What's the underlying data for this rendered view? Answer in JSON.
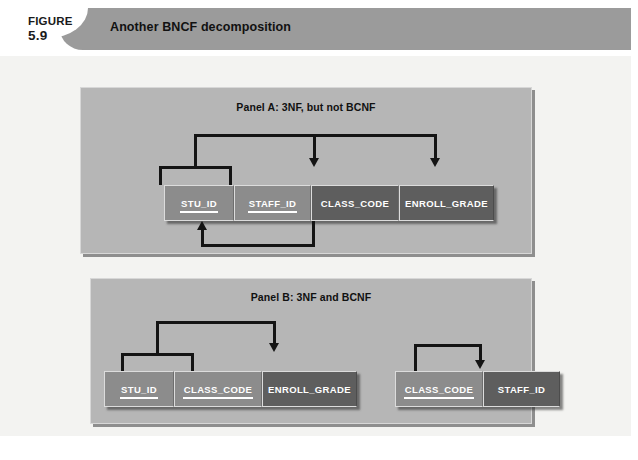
{
  "figure": {
    "label": "FIGURE",
    "number": "5.9",
    "caption": "Another BNCF decomposition"
  },
  "colors": {
    "header_band": "#9b9b9b",
    "page_background": "#f3f3f1",
    "panel_background": "#b6b6b6",
    "key_attribute": "#8c8c8c",
    "nonkey_attribute": "#5e5e5e",
    "arrow": "#141414",
    "attribute_text": "#ffffff"
  },
  "panels": [
    {
      "id": "panel-a",
      "title": "Panel A: 3NF, but not BCNF",
      "relations": [
        {
          "id": "relation-a1",
          "attributes": [
            {
              "name": "STU_ID",
              "key": true
            },
            {
              "name": "STAFF_ID",
              "key": true
            },
            {
              "name": "CLASS_CODE",
              "key": false
            },
            {
              "name": "ENROLL_GRADE",
              "key": false
            }
          ],
          "dependencies": [
            {
              "id": "dep-a-composite-key",
              "determinant": [
                "STU_ID",
                "STAFF_ID"
              ],
              "dependents": [
                "CLASS_CODE",
                "ENROLL_GRADE"
              ],
              "position": "above"
            },
            {
              "id": "dep-a-transitive",
              "determinant": [
                "CLASS_CODE"
              ],
              "dependents": [
                "STAFF_ID"
              ],
              "position": "below"
            }
          ]
        }
      ]
    },
    {
      "id": "panel-b",
      "title": "Panel B: 3NF and BCNF",
      "relations": [
        {
          "id": "relation-b1",
          "attributes": [
            {
              "name": "STU_ID",
              "key": true
            },
            {
              "name": "CLASS_CODE",
              "key": true
            },
            {
              "name": "ENROLL_GRADE",
              "key": false
            }
          ],
          "dependencies": [
            {
              "id": "dep-b1",
              "determinant": [
                "STU_ID",
                "CLASS_CODE"
              ],
              "dependents": [
                "ENROLL_GRADE"
              ],
              "position": "above"
            }
          ]
        },
        {
          "id": "relation-b2",
          "attributes": [
            {
              "name": "CLASS_CODE",
              "key": true
            },
            {
              "name": "STAFF_ID",
              "key": false
            }
          ],
          "dependencies": [
            {
              "id": "dep-b2",
              "determinant": [
                "CLASS_CODE"
              ],
              "dependents": [
                "STAFF_ID"
              ],
              "position": "above"
            }
          ]
        }
      ]
    }
  ]
}
